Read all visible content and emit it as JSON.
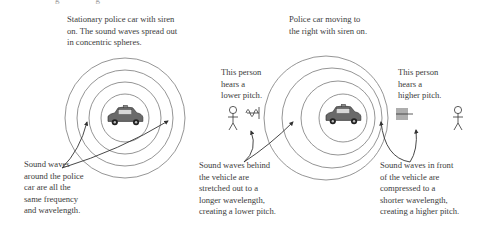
{
  "diagram": {
    "topic": "Doppler effect with a police car siren",
    "cropped_header": "g                g",
    "panels": [
      {
        "id": "stationary",
        "caption": "Stationary police car with siren\non. The sound waves spread out\nin concentric spheres.",
        "note": "Sound waves\naround the police\ncar are all the\nsame frequency\nand wavelength.",
        "car_label": "POLICE"
      },
      {
        "id": "moving",
        "caption": "Police car moving to\nthe right with siren on.",
        "car_label": "POLICE",
        "left_listener": "This person\nhears a\nlower pitch.",
        "right_listener": "This person\nhears a\nhigher pitch.",
        "behind_note": "Sound waves behind\nthe vehicle are\nstretched out to a\nlonger wavelength,\ncreating a lower pitch.",
        "front_note": "Sound waves in front\nof the vehicle are\ncompressed to a\nshorter wavelength,\ncreating a higher pitch."
      }
    ],
    "colors": {
      "line": "#6e6e6e",
      "text": "#3b3b3b",
      "car": "#555555",
      "background": "#ffffff"
    }
  }
}
